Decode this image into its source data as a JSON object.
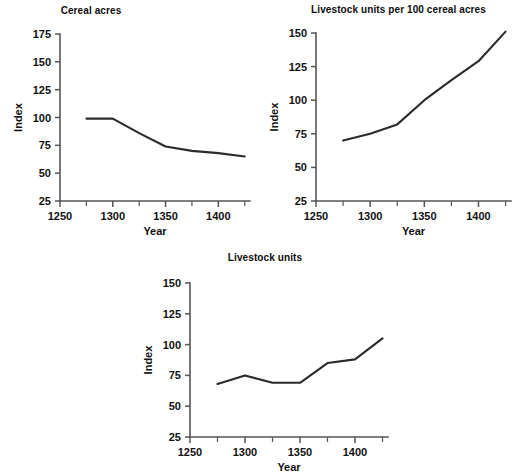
{
  "chart_data": [
    {
      "id": "cereal-acres",
      "type": "line",
      "title": "Cereal acres",
      "xlabel": "Year",
      "ylabel": "Index",
      "xlim": [
        1250,
        1430
      ],
      "ylim": [
        25,
        175
      ],
      "xticks": [
        1250,
        1300,
        1350,
        1400
      ],
      "xticks_minor": [
        1275,
        1325,
        1375,
        1425
      ],
      "yticks": [
        25,
        50,
        75,
        100,
        125,
        150,
        175
      ],
      "grid": false,
      "legend": "none",
      "x": [
        1275,
        1300,
        1325,
        1350,
        1375,
        1400,
        1425
      ],
      "values": [
        99,
        99,
        86,
        74,
        70,
        68,
        65
      ]
    },
    {
      "id": "livestock-units-per-100-cereal-acres",
      "type": "line",
      "title": "Livestock units per 100 cereal acres",
      "xlabel": "Year",
      "ylabel": "Index",
      "xlim": [
        1250,
        1430
      ],
      "ylim": [
        25,
        150
      ],
      "xticks": [
        1250,
        1300,
        1350,
        1400
      ],
      "xticks_minor": [
        1275,
        1325,
        1375,
        1425
      ],
      "yticks": [
        25,
        50,
        75,
        100,
        125,
        150
      ],
      "grid": false,
      "legend": "none",
      "x": [
        1275,
        1300,
        1325,
        1350,
        1375,
        1400,
        1425
      ],
      "values": [
        70,
        75,
        82,
        100,
        115,
        129,
        151
      ]
    },
    {
      "id": "livestock-units",
      "type": "line",
      "title": "Livestock units",
      "xlabel": "Year",
      "ylabel": "Index",
      "xlim": [
        1250,
        1430
      ],
      "ylim": [
        25,
        150
      ],
      "xticks": [
        1250,
        1300,
        1350,
        1400
      ],
      "xticks_minor": [
        1275,
        1325,
        1375,
        1425
      ],
      "yticks": [
        25,
        50,
        75,
        100,
        125,
        150
      ],
      "grid": false,
      "legend": "none",
      "x": [
        1275,
        1300,
        1325,
        1350,
        1375,
        1400,
        1425
      ],
      "values": [
        68,
        75,
        69,
        69,
        85,
        88,
        105
      ]
    }
  ],
  "panels": {
    "cereal_acres": {
      "title": "Cereal acres",
      "xlabel": "Year",
      "ylabel": "Index"
    },
    "livestock_per_100": {
      "title": "Livestock units per 100 cereal acres",
      "xlabel": "Year",
      "ylabel": "Index"
    },
    "livestock_units": {
      "title": "Livestock units",
      "xlabel": "Year",
      "ylabel": "Index"
    }
  },
  "colors": {
    "line": "#2b2b2b",
    "axis": "#555555",
    "text": "#111111",
    "background": "#ffffff"
  }
}
